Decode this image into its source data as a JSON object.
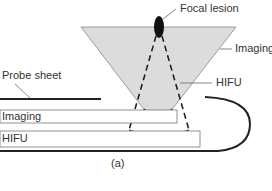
{
  "labels": {
    "focal_lesion": "Focal lesion",
    "imaging_beam": "Imaging",
    "hifu_beam": "HIFU",
    "probe_sheet": "Probe sheet",
    "imaging_transducer": "Imaging",
    "hifu_transducer": "HIFU",
    "caption": "(a)"
  },
  "colors": {
    "imaging_field": "#dcdcdc",
    "lines": "#222222",
    "lesion": "#111111"
  }
}
